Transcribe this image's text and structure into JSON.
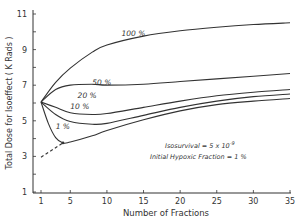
{
  "chart_data": {
    "type": "line",
    "title": "",
    "xlabel": "Number of Fractions",
    "ylabel": "Total Dose for Isoeffect ( K Rads )",
    "xlim": [
      0,
      35
    ],
    "ylim": [
      1,
      11
    ],
    "x_ticks": [
      1,
      5,
      10,
      15,
      20,
      25,
      30,
      35
    ],
    "y_ticks": [
      1,
      3,
      5,
      7,
      9,
      11
    ],
    "grid": false,
    "annotations": [
      "Isosurvival = 5 x 10^-9",
      "Initial Hypoxic Fraction = 1 %"
    ],
    "series": [
      {
        "name": "100 %",
        "label_at": [
          12,
          9.7
        ],
        "x": [
          1,
          3,
          5,
          8,
          10,
          15,
          20,
          25,
          30,
          35
        ],
        "y": [
          6.0,
          7.1,
          7.9,
          8.8,
          9.2,
          9.7,
          10.0,
          10.2,
          10.35,
          10.45
        ]
      },
      {
        "name": "50 %",
        "label_at": [
          8,
          6.95
        ],
        "x": [
          1,
          3,
          5,
          8,
          10,
          15,
          20,
          25,
          30,
          35
        ],
        "y": [
          6.0,
          6.7,
          6.95,
          7.0,
          6.95,
          7.0,
          7.15,
          7.3,
          7.45,
          7.6
        ]
      },
      {
        "name": "20 %",
        "label_at": [
          6,
          6.2
        ],
        "x": [
          1,
          3,
          5,
          8,
          10,
          15,
          20,
          25,
          30,
          35
        ],
        "y": [
          6.0,
          5.7,
          5.4,
          5.3,
          5.35,
          5.7,
          6.05,
          6.35,
          6.55,
          6.7
        ]
      },
      {
        "name": "10 %",
        "label_at": [
          5,
          5.6
        ],
        "x": [
          1,
          3,
          5,
          8,
          10,
          15,
          20,
          25,
          30,
          35
        ],
        "y": [
          6.0,
          5.3,
          4.9,
          4.75,
          4.8,
          5.25,
          5.7,
          6.05,
          6.3,
          6.45
        ]
      },
      {
        "name": "1 %",
        "label_at": [
          3,
          4.5
        ],
        "x": [
          1,
          2,
          3,
          4,
          5,
          8,
          10,
          15,
          20,
          25,
          30,
          35
        ],
        "y": [
          6.0,
          4.8,
          4.0,
          3.7,
          3.75,
          4.1,
          4.4,
          5.0,
          5.5,
          5.85,
          6.05,
          6.2
        ]
      },
      {
        "name": "extrapolation",
        "style": "dashed",
        "x": [
          1,
          4
        ],
        "y": [
          2.9,
          3.7
        ]
      }
    ]
  },
  "labels": {
    "xlabel": "Number of Fractions",
    "ylabel": "Total Dose for Isoeffect ( K Rads )",
    "annotation1": "Isosurvival = 5 x 10",
    "annotation1_exp": "-9",
    "annotation2": "Initial Hypoxic Fraction = 1 %"
  }
}
